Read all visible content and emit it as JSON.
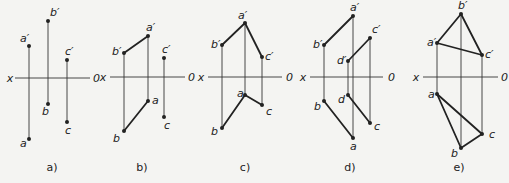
{
  "figure": {
    "colors": {
      "background": "#f4f4f2",
      "ink": "#222222",
      "thin_line": "#333333"
    },
    "panels": [
      {
        "id": "a",
        "caption": "a)",
        "axis": {
          "x_label": "x",
          "o_label": "0",
          "x1": 15,
          "x2": 90,
          "y": 78,
          "xlab_x": 10,
          "olab_x": 93
        },
        "points": [
          {
            "name": "a'",
            "x": 29,
            "y": 46,
            "lx": 20,
            "ly": 42
          },
          {
            "name": "b'",
            "x": 48,
            "y": 21,
            "lx": 50,
            "ly": 16
          },
          {
            "name": "c'",
            "x": 67,
            "y": 60,
            "lx": 65,
            "ly": 55
          },
          {
            "name": "b",
            "x": 48,
            "y": 104,
            "lx": 42,
            "ly": 115
          },
          {
            "name": "c",
            "x": 67,
            "y": 122,
            "lx": 65,
            "ly": 134
          },
          {
            "name": "a",
            "x": 29,
            "y": 139,
            "lx": 20,
            "ly": 147
          }
        ],
        "projectors": [
          [
            "a'",
            "a"
          ],
          [
            "b'",
            "b"
          ],
          [
            "c'",
            "c"
          ]
        ],
        "segments": []
      },
      {
        "id": "b",
        "caption": "b)",
        "axis": {
          "x_label": "x",
          "o_label": "0",
          "x1": 110,
          "x2": 185,
          "y": 77,
          "xlab_x": 103,
          "olab_x": 188
        },
        "points": [
          {
            "name": "a'",
            "x": 148,
            "y": 36,
            "lx": 146,
            "ly": 31
          },
          {
            "name": "b'",
            "x": 124,
            "y": 53,
            "lx": 112,
            "ly": 55
          },
          {
            "name": "c'",
            "x": 164,
            "y": 58,
            "lx": 162,
            "ly": 53
          },
          {
            "name": "a",
            "x": 148,
            "y": 101,
            "lx": 152,
            "ly": 104
          },
          {
            "name": "c",
            "x": 164,
            "y": 117,
            "lx": 164,
            "ly": 129
          },
          {
            "name": "b",
            "x": 124,
            "y": 131,
            "lx": 113,
            "ly": 142
          }
        ],
        "projectors": [
          [
            "a'",
            "a"
          ],
          [
            "b'",
            "b"
          ],
          [
            "c'",
            "c"
          ]
        ],
        "segments": [
          [
            "a'",
            "b'"
          ],
          [
            "a",
            "b"
          ]
        ]
      },
      {
        "id": "c",
        "caption": "c)",
        "axis": {
          "x_label": "x",
          "o_label": "0",
          "x1": 208,
          "x2": 282,
          "y": 77,
          "xlab_x": 201,
          "olab_x": 286
        },
        "points": [
          {
            "name": "a'",
            "x": 245,
            "y": 23,
            "lx": 238,
            "ly": 19
          },
          {
            "name": "b'",
            "x": 222,
            "y": 45,
            "lx": 211,
            "ly": 48
          },
          {
            "name": "c'",
            "x": 262,
            "y": 57,
            "lx": 265,
            "ly": 60
          },
          {
            "name": "a",
            "x": 245,
            "y": 95,
            "lx": 237,
            "ly": 97
          },
          {
            "name": "c",
            "x": 262,
            "y": 105,
            "lx": 266,
            "ly": 115
          },
          {
            "name": "b",
            "x": 222,
            "y": 128,
            "lx": 211,
            "ly": 135
          }
        ],
        "projectors": [
          [
            "a'",
            "a"
          ],
          [
            "b'",
            "b"
          ],
          [
            "c'",
            "c"
          ]
        ],
        "segments": [
          [
            "b'",
            "a'"
          ],
          [
            "a'",
            "c'"
          ],
          [
            "b",
            "a"
          ],
          [
            "a",
            "c"
          ]
        ]
      },
      {
        "id": "d",
        "caption": "d)",
        "axis": {
          "x_label": "x",
          "o_label": "0",
          "x1": 310,
          "x2": 383,
          "y": 77,
          "xlab_x": 303,
          "olab_x": 388
        },
        "points": [
          {
            "name": "a'",
            "x": 353,
            "y": 16,
            "lx": 350,
            "ly": 11
          },
          {
            "name": "b'",
            "x": 324,
            "y": 45,
            "lx": 313,
            "ly": 48
          },
          {
            "name": "c'",
            "x": 370,
            "y": 38,
            "lx": 372,
            "ly": 33
          },
          {
            "name": "d'",
            "x": 348,
            "y": 61,
            "lx": 337,
            "ly": 64
          },
          {
            "name": "d",
            "x": 348,
            "y": 95,
            "lx": 338,
            "ly": 103
          },
          {
            "name": "b",
            "x": 324,
            "y": 101,
            "lx": 314,
            "ly": 110
          },
          {
            "name": "c",
            "x": 370,
            "y": 123,
            "lx": 374,
            "ly": 130
          },
          {
            "name": "a",
            "x": 353,
            "y": 138,
            "lx": 350,
            "ly": 150
          }
        ],
        "projectors": [
          [
            "a'",
            "a"
          ],
          [
            "b'",
            "b"
          ],
          [
            "c'",
            "c"
          ],
          [
            "d'",
            "d"
          ]
        ],
        "segments": [
          [
            "b'",
            "a'"
          ],
          [
            "d'",
            "c'"
          ],
          [
            "b",
            "a"
          ],
          [
            "d",
            "c"
          ]
        ]
      },
      {
        "id": "e",
        "caption": "e)",
        "axis": {
          "x_label": "x",
          "o_label": "0",
          "x1": 423,
          "x2": 498,
          "y": 77,
          "xlab_x": 416,
          "olab_x": 501
        },
        "points": [
          {
            "name": "b'",
            "x": 461,
            "y": 14,
            "lx": 458,
            "ly": 9
          },
          {
            "name": "a'",
            "x": 437,
            "y": 43,
            "lx": 427,
            "ly": 46
          },
          {
            "name": "c'",
            "x": 482,
            "y": 55,
            "lx": 485,
            "ly": 58
          },
          {
            "name": "a",
            "x": 437,
            "y": 94,
            "lx": 428,
            "ly": 98
          },
          {
            "name": "c",
            "x": 482,
            "y": 134,
            "lx": 489,
            "ly": 138
          },
          {
            "name": "b",
            "x": 461,
            "y": 148,
            "lx": 451,
            "ly": 157
          }
        ],
        "projectors": [
          [
            "a'",
            "a"
          ],
          [
            "b'",
            "b"
          ],
          [
            "c'",
            "c"
          ]
        ],
        "segments": [
          [
            "a'",
            "b'"
          ],
          [
            "b'",
            "c'"
          ],
          [
            "c'",
            "a'"
          ],
          [
            "a",
            "b"
          ],
          [
            "b",
            "c"
          ],
          [
            "c",
            "a"
          ]
        ]
      }
    ],
    "captions_y": 171,
    "caption_x": [
      52,
      142,
      245,
      350,
      459
    ]
  }
}
